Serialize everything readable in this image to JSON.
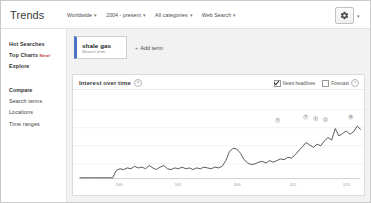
{
  "header": {
    "logo": "Trends",
    "nav": [
      {
        "label": "Worldwide",
        "caret": "▾"
      },
      {
        "label": "2004 - present",
        "caret": "▾"
      },
      {
        "label": "All categories",
        "caret": "▾"
      },
      {
        "label": "Web Search",
        "caret": "▾"
      }
    ],
    "settings_icon": "gear-icon",
    "settings_caret": "▾"
  },
  "sidebar": {
    "top_items": [
      {
        "label": "Hot Searches",
        "badge": ""
      },
      {
        "label": "Top Charts",
        "badge": "New!"
      },
      {
        "label": "Explore",
        "badge": ""
      }
    ],
    "section_title": "Compare",
    "compare_items": [
      {
        "label": "Search terms"
      },
      {
        "label": "Locations"
      },
      {
        "label": "Time ranges"
      }
    ]
  },
  "terms": {
    "items": [
      {
        "name": "shale gas",
        "type": "Search term",
        "color": "#4b73c4"
      }
    ],
    "add_label": "Add term",
    "add_plus": "+"
  },
  "card": {
    "title": "Interest over time",
    "info_icon": "?",
    "options": [
      {
        "label": "News headlines",
        "checked": true
      },
      {
        "label": "Forecast",
        "checked": false
      }
    ],
    "forecast_info_icon": "?"
  },
  "chart_data": {
    "type": "line",
    "title": "Interest over time",
    "xlabel": "",
    "ylabel": "Search interest",
    "ylim": [
      0,
      100
    ],
    "grid": true,
    "legend": "",
    "series_name": "shale gas",
    "series_color": "#3b3b3b",
    "xticks": [
      "2005",
      "2007",
      "2009",
      "2011",
      "2013"
    ],
    "xtick_positions": [
      14,
      35,
      56,
      76,
      95
    ],
    "x": [
      0,
      1.3,
      2.6,
      3.9,
      5.2,
      6.5,
      7.8,
      9.1,
      10.4,
      11.7,
      13,
      14.3,
      15.6,
      16.9,
      18.2,
      19.5,
      20.8,
      22.1,
      23.4,
      24.7,
      26,
      27.3,
      28.6,
      29.9,
      31.2,
      32.5,
      33.8,
      35.1,
      36.4,
      37.7,
      39,
      40.3,
      41.6,
      42.9,
      44.2,
      45.5,
      46.8,
      48.1,
      49.4,
      50.7,
      52,
      53.3,
      54.6,
      55.9,
      57.2,
      58.5,
      59.8,
      61.1,
      62.4,
      63.7,
      65,
      66.3,
      67.6,
      68.9,
      70.2,
      71.5,
      72.8,
      74.1,
      75.4,
      76.7,
      78,
      79.3,
      80.6,
      81.9,
      83.2,
      84.5,
      85.8,
      87.1,
      88.4,
      89.7,
      91,
      92.3,
      93.6,
      94.9,
      96.2,
      97.5,
      98.8,
      100
    ],
    "values": [
      1,
      1,
      1,
      1,
      1,
      1,
      1,
      1,
      1,
      1,
      10,
      12,
      11,
      13,
      12,
      15,
      13,
      14,
      12,
      16,
      13,
      11,
      14,
      16,
      12,
      11,
      13,
      12,
      14,
      12,
      13,
      11,
      13,
      12,
      14,
      13,
      12,
      14,
      13,
      15,
      22,
      33,
      37,
      36,
      31,
      23,
      19,
      17,
      18,
      20,
      21,
      19,
      22,
      20,
      22,
      24,
      23,
      26,
      25,
      29,
      34,
      39,
      44,
      41,
      38,
      42,
      40,
      46,
      50,
      47,
      61,
      52,
      55,
      58,
      54,
      57,
      64,
      60
    ],
    "annotations": [
      {
        "label": "G",
        "x": 70.5,
        "y": 62
      },
      {
        "label": "F",
        "x": 80.5,
        "y": 66
      },
      {
        "label": "E",
        "x": 84.0,
        "y": 64
      },
      {
        "label": "D",
        "x": 87.5,
        "y": 63
      },
      {
        "label": "A",
        "x": 96.5,
        "y": 66
      }
    ]
  }
}
